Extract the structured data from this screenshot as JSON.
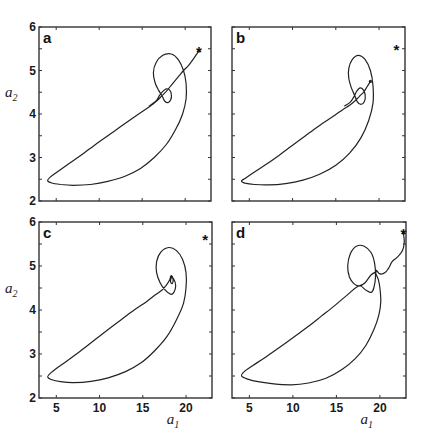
{
  "chart_data": [
    {
      "type": "line",
      "panel": "a",
      "xlabel": "a1",
      "ylabel": "a2",
      "xlim": [
        3,
        23
      ],
      "ylim": [
        2,
        6
      ],
      "xticks": [
        5,
        10,
        15,
        20
      ],
      "yticks": [
        2,
        3,
        4,
        5,
        6
      ],
      "show_xticklabels": false,
      "show_yticklabels": true,
      "show_xlabel": false,
      "show_ylabel": true,
      "marker_star": [
        21.6,
        5.45
      ],
      "series": [
        {
          "name": "trajectory",
          "points": [
            [
              21.6,
              5.45
            ],
            [
              21.0,
              5.28
            ],
            [
              20.4,
              5.12
            ],
            [
              19.8,
              5.0
            ],
            [
              19.3,
              4.88
            ],
            [
              18.8,
              4.76
            ],
            [
              18.3,
              4.64
            ],
            [
              17.8,
              4.52
            ],
            [
              17.3,
              4.42
            ],
            [
              16.8,
              4.32
            ],
            [
              16.2,
              4.22
            ],
            [
              15.5,
              4.12
            ],
            [
              14.0,
              3.92
            ],
            [
              12.5,
              3.71
            ],
            [
              11.0,
              3.5
            ],
            [
              9.5,
              3.29
            ],
            [
              8.0,
              3.07
            ],
            [
              6.5,
              2.86
            ],
            [
              5.2,
              2.68
            ],
            [
              4.3,
              2.55
            ],
            [
              4.0,
              2.47
            ],
            [
              4.4,
              2.42
            ],
            [
              5.5,
              2.38
            ],
            [
              7.0,
              2.36
            ],
            [
              9.0,
              2.38
            ],
            [
              11.0,
              2.45
            ],
            [
              13.0,
              2.57
            ],
            [
              14.8,
              2.75
            ],
            [
              16.4,
              3.0
            ],
            [
              17.8,
              3.3
            ],
            [
              18.9,
              3.65
            ],
            [
              19.7,
              4.0
            ],
            [
              20.1,
              4.35
            ],
            [
              20.1,
              4.7
            ],
            [
              19.8,
              5.0
            ],
            [
              19.2,
              5.25
            ],
            [
              18.4,
              5.38
            ],
            [
              17.4,
              5.35
            ],
            [
              16.6,
              5.18
            ],
            [
              16.3,
              4.95
            ],
            [
              16.5,
              4.72
            ],
            [
              16.9,
              4.55
            ],
            [
              17.3,
              4.42
            ],
            [
              17.6,
              4.3
            ],
            [
              18.0,
              4.26
            ],
            [
              18.3,
              4.32
            ],
            [
              18.4,
              4.44
            ],
            [
              18.2,
              4.55
            ],
            [
              17.8,
              4.58
            ],
            [
              17.4,
              4.52
            ],
            [
              17.0,
              4.42
            ],
            [
              16.6,
              4.3
            ],
            [
              15.8,
              4.18
            ]
          ]
        }
      ]
    },
    {
      "type": "line",
      "panel": "b",
      "xlabel": "a1",
      "ylabel": "a2",
      "xlim": [
        3,
        23
      ],
      "ylim": [
        2,
        6
      ],
      "xticks": [
        5,
        10,
        15,
        20
      ],
      "yticks": [
        2,
        3,
        4,
        5,
        6
      ],
      "show_xticklabels": false,
      "show_yticklabels": false,
      "show_xlabel": false,
      "show_ylabel": false,
      "marker_star": [
        22.0,
        5.5
      ],
      "series": [
        {
          "name": "trajectory",
          "points": [
            [
              19.0,
              4.75
            ],
            [
              18.6,
              4.62
            ],
            [
              18.2,
              4.5
            ],
            [
              17.7,
              4.4
            ],
            [
              17.2,
              4.3
            ],
            [
              16.6,
              4.2
            ],
            [
              15.8,
              4.1
            ],
            [
              14.5,
              3.92
            ],
            [
              13.0,
              3.72
            ],
            [
              11.5,
              3.5
            ],
            [
              10.0,
              3.28
            ],
            [
              8.5,
              3.06
            ],
            [
              7.0,
              2.85
            ],
            [
              5.6,
              2.67
            ],
            [
              4.5,
              2.52
            ],
            [
              4.1,
              2.46
            ],
            [
              4.5,
              2.41
            ],
            [
              5.6,
              2.38
            ],
            [
              7.2,
              2.37
            ],
            [
              9.2,
              2.4
            ],
            [
              11.2,
              2.48
            ],
            [
              13.2,
              2.62
            ],
            [
              15.0,
              2.82
            ],
            [
              16.6,
              3.1
            ],
            [
              17.9,
              3.45
            ],
            [
              18.8,
              3.85
            ],
            [
              19.3,
              4.25
            ],
            [
              19.3,
              4.65
            ],
            [
              19.0,
              5.0
            ],
            [
              18.4,
              5.25
            ],
            [
              17.6,
              5.35
            ],
            [
              16.9,
              5.25
            ],
            [
              16.5,
              5.05
            ],
            [
              16.5,
              4.82
            ],
            [
              16.8,
              4.6
            ],
            [
              17.2,
              4.42
            ],
            [
              17.5,
              4.28
            ],
            [
              17.9,
              4.22
            ],
            [
              18.3,
              4.28
            ],
            [
              18.4,
              4.42
            ],
            [
              18.2,
              4.55
            ],
            [
              17.8,
              4.6
            ],
            [
              17.4,
              4.52
            ],
            [
              17.1,
              4.4
            ],
            [
              16.7,
              4.28
            ],
            [
              16.0,
              4.18
            ]
          ]
        }
      ]
    },
    {
      "type": "line",
      "panel": "c",
      "xlabel": "a1",
      "ylabel": "a2",
      "xlim": [
        3,
        23
      ],
      "ylim": [
        2,
        6
      ],
      "xticks": [
        5,
        10,
        15,
        20
      ],
      "yticks": [
        2,
        3,
        4,
        5,
        6
      ],
      "show_xticklabels": true,
      "show_yticklabels": true,
      "show_xlabel": true,
      "show_ylabel": true,
      "marker_star": [
        22.2,
        5.62
      ],
      "series": [
        {
          "name": "trajectory",
          "points": [
            [
              18.3,
              4.75
            ],
            [
              18.2,
              4.65
            ],
            [
              18.4,
              4.6
            ],
            [
              18.5,
              4.7
            ],
            [
              18.3,
              4.78
            ],
            [
              18.1,
              4.68
            ],
            [
              17.7,
              4.56
            ],
            [
              17.2,
              4.45
            ],
            [
              16.5,
              4.35
            ],
            [
              15.5,
              4.2
            ],
            [
              14.0,
              4.0
            ],
            [
              12.5,
              3.78
            ],
            [
              11.0,
              3.56
            ],
            [
              9.5,
              3.33
            ],
            [
              8.0,
              3.1
            ],
            [
              6.5,
              2.88
            ],
            [
              5.2,
              2.7
            ],
            [
              4.3,
              2.56
            ],
            [
              4.0,
              2.48
            ],
            [
              4.4,
              2.42
            ],
            [
              5.5,
              2.37
            ],
            [
              7.0,
              2.35
            ],
            [
              9.0,
              2.38
            ],
            [
              11.0,
              2.46
            ],
            [
              13.0,
              2.6
            ],
            [
              14.8,
              2.8
            ],
            [
              16.4,
              3.08
            ],
            [
              17.8,
              3.4
            ],
            [
              18.9,
              3.78
            ],
            [
              19.7,
              4.15
            ],
            [
              20.0,
              4.5
            ],
            [
              20.0,
              4.85
            ],
            [
              19.6,
              5.15
            ],
            [
              18.9,
              5.35
            ],
            [
              18.0,
              5.42
            ],
            [
              17.1,
              5.32
            ],
            [
              16.6,
              5.1
            ],
            [
              16.6,
              4.85
            ],
            [
              17.0,
              4.62
            ],
            [
              17.6,
              4.45
            ],
            [
              18.2,
              4.36
            ],
            [
              18.6,
              4.4
            ],
            [
              18.8,
              4.55
            ],
            [
              18.6,
              4.7
            ],
            [
              18.3,
              4.75
            ]
          ]
        }
      ]
    },
    {
      "type": "line",
      "panel": "d",
      "xlabel": "a1",
      "ylabel": "a2",
      "xlim": [
        3,
        23
      ],
      "ylim": [
        2,
        6
      ],
      "xticks": [
        5,
        10,
        15,
        20
      ],
      "yticks": [
        2,
        3,
        4,
        5,
        6
      ],
      "show_xticklabels": true,
      "show_yticklabels": false,
      "show_xlabel": true,
      "show_ylabel": false,
      "marker_star": [
        22.7,
        5.75
      ],
      "series": [
        {
          "name": "trajectory",
          "points": [
            [
              22.7,
              5.75
            ],
            [
              22.8,
              5.55
            ],
            [
              22.6,
              5.35
            ],
            [
              22.0,
              5.2
            ],
            [
              21.4,
              5.1
            ],
            [
              21.0,
              4.95
            ],
            [
              20.6,
              4.85
            ],
            [
              20.0,
              4.82
            ],
            [
              19.6,
              4.9
            ],
            [
              19.5,
              4.85
            ],
            [
              19.8,
              4.7
            ],
            [
              20.0,
              4.5
            ],
            [
              20.1,
              4.2
            ],
            [
              19.9,
              3.9
            ],
            [
              19.3,
              3.55
            ],
            [
              18.4,
              3.2
            ],
            [
              17.2,
              2.9
            ],
            [
              15.6,
              2.64
            ],
            [
              13.8,
              2.45
            ],
            [
              11.8,
              2.34
            ],
            [
              9.8,
              2.3
            ],
            [
              7.8,
              2.32
            ],
            [
              6.0,
              2.37
            ],
            [
              4.8,
              2.43
            ],
            [
              4.1,
              2.5
            ],
            [
              4.4,
              2.6
            ],
            [
              5.4,
              2.74
            ],
            [
              6.8,
              2.92
            ],
            [
              8.4,
              3.14
            ],
            [
              10.0,
              3.37
            ],
            [
              11.6,
              3.6
            ],
            [
              13.2,
              3.85
            ],
            [
              14.8,
              4.1
            ],
            [
              16.3,
              4.35
            ],
            [
              17.6,
              4.55
            ],
            [
              18.4,
              4.45
            ],
            [
              19.0,
              4.4
            ],
            [
              19.3,
              4.5
            ],
            [
              19.5,
              4.75
            ],
            [
              19.4,
              5.05
            ],
            [
              19.0,
              5.3
            ],
            [
              18.2,
              5.45
            ],
            [
              17.3,
              5.45
            ],
            [
              16.6,
              5.28
            ],
            [
              16.3,
              5.0
            ],
            [
              16.5,
              4.75
            ],
            [
              17.0,
              4.6
            ],
            [
              17.6,
              4.55
            ],
            [
              18.3,
              4.62
            ],
            [
              19.0,
              4.8
            ],
            [
              19.7,
              4.88
            ]
          ]
        }
      ]
    }
  ],
  "figure": {
    "panel_labels": [
      "a",
      "b",
      "c",
      "d"
    ],
    "xlabel_text": "a",
    "xlabel_sub": "1",
    "ylabel_text": "a",
    "ylabel_sub": "2",
    "star_glyph": "*",
    "line_color": "#222222",
    "axis_color": "#333333"
  }
}
